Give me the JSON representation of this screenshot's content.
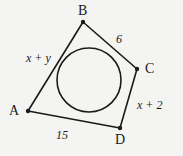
{
  "figure": {
    "background_color": "#f4f4f2",
    "ink_color": "#1a1a1a",
    "vertices": [
      {
        "name": "B",
        "label": "B",
        "x": 83,
        "y": 22,
        "label_x": 78,
        "label_y": 4
      },
      {
        "name": "C",
        "label": "C",
        "x": 137,
        "y": 69,
        "label_x": 145,
        "label_y": 62
      },
      {
        "name": "D",
        "label": "D",
        "x": 120,
        "y": 128,
        "label_x": 115,
        "label_y": 133
      },
      {
        "name": "A",
        "label": "A",
        "x": 28,
        "y": 111,
        "label_x": 9,
        "label_y": 104
      }
    ],
    "sides": [
      {
        "name": "side-ab",
        "from": "A",
        "to": "B",
        "label": "x + y",
        "label_x": 26,
        "label_y": 52
      },
      {
        "name": "side-bc",
        "from": "B",
        "to": "C",
        "label": "6",
        "label_x": 116,
        "label_y": 33
      },
      {
        "name": "side-cd",
        "from": "C",
        "to": "D",
        "label": "x + 2",
        "label_x": 137,
        "label_y": 99
      },
      {
        "name": "side-da",
        "from": "D",
        "to": "A",
        "label": "15",
        "label_x": 56,
        "label_y": 129
      }
    ],
    "circle": {
      "name": "inscribed-circle",
      "cx": 89,
      "cy": 80,
      "r": 32
    }
  }
}
